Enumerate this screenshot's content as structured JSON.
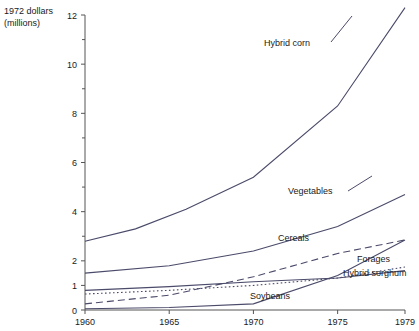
{
  "chart_data": {
    "type": "line",
    "title": "",
    "subtitle": "",
    "ylabel_line1": "1972 dollars",
    "ylabel_line2": "(millions)",
    "xlabel": "",
    "x": [
      1960,
      1965,
      1970,
      1975,
      1979
    ],
    "xtick_labels": [
      "1960",
      "1965",
      "1970",
      "1975",
      "1979"
    ],
    "ytick_labels": [
      "0",
      "1",
      "2",
      "4",
      "6",
      "8",
      "10",
      "12"
    ],
    "ytick_values": [
      0,
      1,
      2,
      4,
      6,
      8,
      10,
      12
    ],
    "yminor_values": [
      3,
      5,
      7,
      9,
      11
    ],
    "ylim": [
      0,
      12
    ],
    "grid": false,
    "legend_position": "inline-annotations",
    "series": [
      {
        "name": "Hybrid corn",
        "style": "solid",
        "label": "Hybrid corn",
        "values": [
          2.8,
          3.3,
          4.1,
          5.4,
          8.3,
          12.3
        ],
        "x_values": [
          1960,
          1963,
          1966,
          1970,
          1975,
          1979
        ]
      },
      {
        "name": "Vegetables",
        "style": "solid",
        "label": "Vegetables",
        "values": [
          1.5,
          1.8,
          2.4,
          3.4,
          4.7
        ],
        "x_values": [
          1960,
          1965,
          1970,
          1975,
          1979
        ]
      },
      {
        "name": "Cereals",
        "style": "dashed",
        "label": "Cereals",
        "values": [
          0.25,
          0.6,
          1.35,
          2.3,
          2.85
        ],
        "x_values": [
          1960,
          1965,
          1970,
          1975,
          1979
        ]
      },
      {
        "name": "Forages",
        "style": "dotted",
        "label": "Forages",
        "values": [
          0.65,
          0.8,
          1.0,
          1.3,
          1.75
        ],
        "x_values": [
          1960,
          1965,
          1970,
          1975,
          1979
        ]
      },
      {
        "name": "Hybrid sorghum",
        "style": "solid",
        "label": "Hybrid sorghum",
        "values": [
          0.8,
          0.95,
          1.15,
          1.3,
          1.6
        ],
        "x_values": [
          1960,
          1965,
          1970,
          1975,
          1979
        ]
      },
      {
        "name": "Soybeans",
        "style": "solid",
        "label": "Soybeans",
        "values": [
          0.05,
          0.1,
          0.25,
          1.4,
          2.85
        ],
        "x_values": [
          1960,
          1965,
          1970,
          1975,
          1979
        ]
      }
    ]
  },
  "colors": {
    "line": "#4a4a6a",
    "axis": "#555555",
    "text": "#1a1a1a",
    "background": "#ffffff"
  }
}
